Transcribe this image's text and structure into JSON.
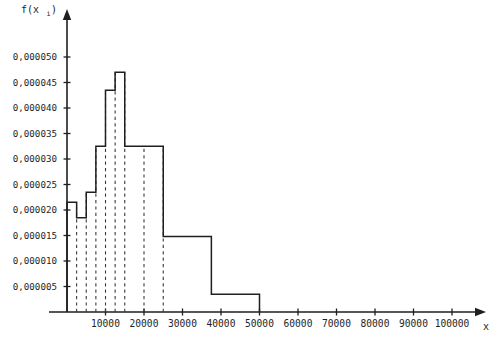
{
  "chart_data": {
    "type": "bar",
    "title": "",
    "subtitle": "",
    "xlabel": "x",
    "ylabel": "f(x",
    "ylabel_sub": "i",
    "ylabel_close": ")",
    "xlim": [
      0,
      100000
    ],
    "ylim": [
      0,
      5.3e-05
    ],
    "grid": false,
    "legend": null,
    "annotations": [],
    "y_ticks": [
      5e-06,
      1e-05,
      1.5e-05,
      2e-05,
      2.5e-05,
      3e-05,
      3.5e-05,
      4e-05,
      4.5e-05,
      5e-05
    ],
    "y_tick_labels": [
      "0,000005",
      "0,000010",
      "0,000015",
      "0,000020",
      "0,000025",
      "0,000030",
      "0,000035",
      "0,000040",
      "0,000045",
      "0,000050"
    ],
    "x_ticks": [
      10000,
      20000,
      30000,
      40000,
      50000,
      60000,
      70000,
      80000,
      90000,
      100000
    ],
    "x_tick_labels": [
      "10000",
      "20000",
      "30000",
      "40000",
      "50000",
      "60000",
      "70000",
      "80000",
      "90000",
      "100000"
    ],
    "bin_edges": [
      0,
      2500,
      5000,
      7500,
      10000,
      12500,
      15000,
      20000,
      25000,
      37500,
      50000
    ],
    "values": [
      2.15e-05,
      1.85e-05,
      2.35e-05,
      3.25e-05,
      4.35e-05,
      4.7e-05,
      3.25e-05,
      3.25e-05,
      1.48e-05,
      3.5e-06
    ],
    "dashed_droplines_x": [
      2500,
      5000,
      7500,
      10000,
      12500,
      15000,
      20000,
      25000
    ]
  },
  "style": {
    "stroke": "#1f1f1f",
    "background": "#ffffff",
    "dash_color": "#3a3a3a"
  }
}
